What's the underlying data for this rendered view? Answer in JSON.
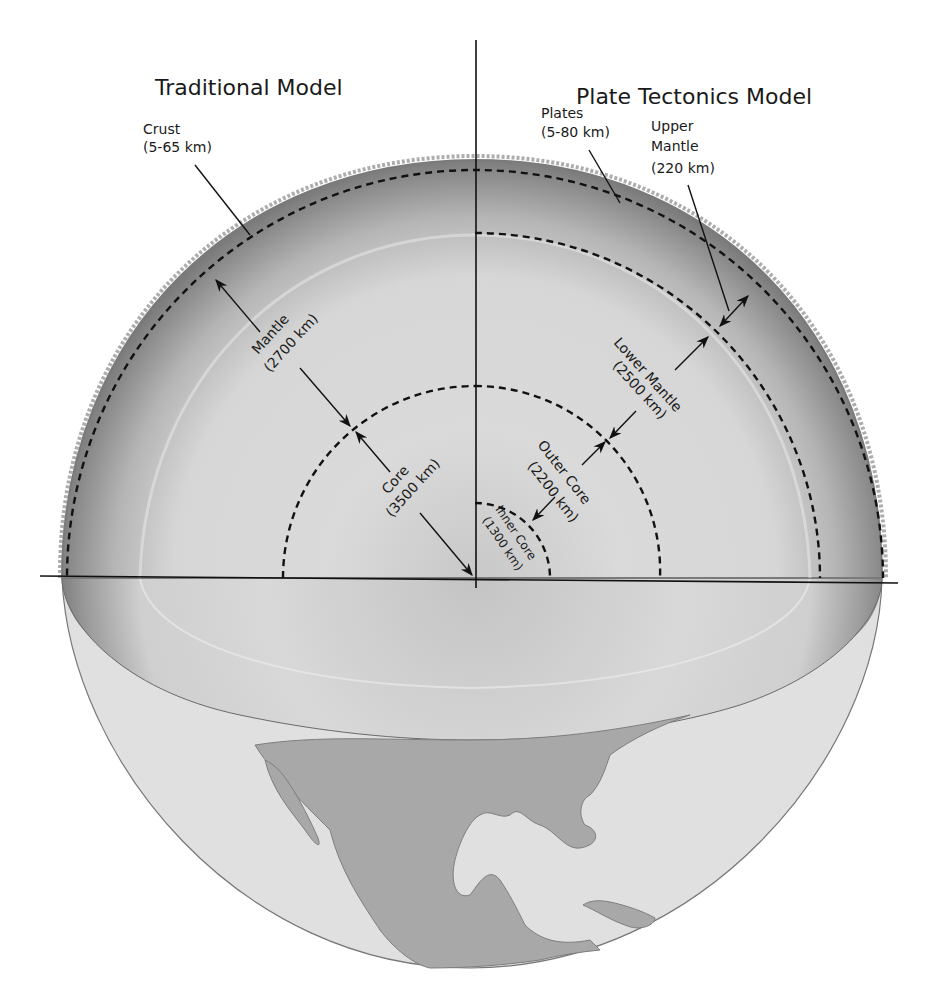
{
  "titles": {
    "left": "Traditional Model",
    "right": "Plate Tectonics Model"
  },
  "traditional_model": {
    "crust": {
      "name": "Crust",
      "thickness": "(5-65 km)"
    },
    "mantle": {
      "name": "Mantle",
      "thickness": "(2700 km)"
    },
    "core": {
      "name": "Core",
      "thickness": "(3500 km)"
    }
  },
  "plate_tectonics_model": {
    "plates": {
      "name": "Plates",
      "thickness": "(5-80 km)"
    },
    "upper_mantle": {
      "name1": "Upper",
      "name2": "Mantle",
      "thickness": "(220 km)"
    },
    "lower_mantle": {
      "name": "Lower Mantle",
      "thickness": "(2500 km)"
    },
    "outer_core": {
      "name": "Outer Core",
      "thickness": "(2200 km)"
    },
    "inner_core": {
      "name": "Inner Core",
      "thickness": "(1300 km)"
    }
  },
  "colors": {
    "background": "#ffffff",
    "interior_light": "#d9d9d9",
    "mantle_dark": "#8a8a8a",
    "globe_surface": "#e0e0e0",
    "continents": "#a8a8a8",
    "lines": "#111111"
  }
}
